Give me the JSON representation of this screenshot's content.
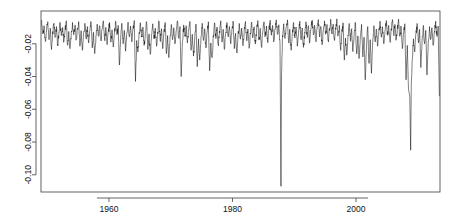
{
  "chart_data": {
    "type": "line",
    "title": "",
    "subtitle": "",
    "xlabel": "",
    "ylabel": "",
    "xlim": [
      1949.0,
      2013.6
    ],
    "ylim": [
      -0.1105,
      0.0
    ],
    "xticks": [
      1960,
      1980,
      2000
    ],
    "xtick_labels": [
      "1960",
      "1980",
      "2000"
    ],
    "yticks": [
      -0.02,
      -0.04,
      -0.06,
      -0.08,
      -0.1
    ],
    "ytick_labels": [
      "-0.02",
      "-0.04",
      "-0.06",
      "-0.08",
      "-0.10"
    ],
    "ytick_rotation": 90,
    "grid": false,
    "legend": false,
    "box": true,
    "line_color": "#000000",
    "line_width": 0.5,
    "background_color": "#ffffff",
    "axis_color": "#3c3c3c",
    "series": [
      {
        "name": "drawdown",
        "x": [
          1949.1,
          1949.3,
          1949.5,
          1949.7,
          1949.9,
          1950.1,
          1950.3,
          1950.5,
          1950.7,
          1950.9,
          1951.1,
          1951.3,
          1951.5,
          1951.7,
          1951.9,
          1952.1,
          1952.3,
          1952.5,
          1952.7,
          1952.9,
          1953.1,
          1953.3,
          1953.5,
          1953.7,
          1953.9,
          1954.1,
          1954.3,
          1954.5,
          1954.7,
          1954.9,
          1955.1,
          1955.3,
          1955.5,
          1955.7,
          1955.9,
          1956.1,
          1956.3,
          1956.5,
          1956.7,
          1956.9,
          1957.1,
          1957.3,
          1957.5,
          1957.7,
          1957.9,
          1958.1,
          1958.3,
          1958.5,
          1958.7,
          1958.9,
          1959.1,
          1959.3,
          1959.5,
          1959.7,
          1959.9,
          1960.1,
          1960.3,
          1960.5,
          1960.7,
          1960.9,
          1961.1,
          1961.3,
          1961.5,
          1961.7,
          1961.9,
          1962.1,
          1962.3,
          1962.5,
          1962.7,
          1962.9,
          1963.1,
          1963.3,
          1963.5,
          1963.7,
          1963.9,
          1964.1,
          1964.3,
          1964.5,
          1964.7,
          1964.9,
          1965.1,
          1965.3,
          1965.5,
          1965.7,
          1965.9,
          1966.1,
          1966.3,
          1966.5,
          1966.7,
          1966.9,
          1967.1,
          1967.3,
          1967.5,
          1967.7,
          1967.9,
          1968.1,
          1968.3,
          1968.5,
          1968.7,
          1968.9,
          1969.1,
          1969.3,
          1969.5,
          1969.7,
          1969.9,
          1970.1,
          1970.3,
          1970.5,
          1970.7,
          1970.9,
          1971.1,
          1971.3,
          1971.5,
          1971.7,
          1971.9,
          1972.1,
          1972.3,
          1972.5,
          1972.7,
          1972.9,
          1973.1,
          1973.3,
          1973.5,
          1973.7,
          1973.9,
          1974.1,
          1974.3,
          1974.5,
          1974.7,
          1974.9,
          1975.1,
          1975.3,
          1975.5,
          1975.7,
          1975.9,
          1976.1,
          1976.3,
          1976.5,
          1976.7,
          1976.9,
          1977.1,
          1977.3,
          1977.5,
          1977.7,
          1977.9,
          1978.1,
          1978.3,
          1978.5,
          1978.7,
          1978.9,
          1979.1,
          1979.3,
          1979.5,
          1979.7,
          1979.9,
          1980.1,
          1980.3,
          1980.5,
          1980.7,
          1980.9,
          1981.1,
          1981.3,
          1981.5,
          1981.7,
          1981.9,
          1982.1,
          1982.3,
          1982.5,
          1982.7,
          1982.9,
          1983.1,
          1983.3,
          1983.5,
          1983.7,
          1983.9,
          1984.1,
          1984.3,
          1984.5,
          1984.7,
          1984.9,
          1985.1,
          1985.3,
          1985.5,
          1985.7,
          1985.9,
          1986.1,
          1986.3,
          1986.5,
          1986.7,
          1986.9,
          1987.1,
          1987.3,
          1987.5,
          1987.7,
          1987.85,
          1987.95,
          1988.1,
          1988.3,
          1988.5,
          1988.7,
          1988.9,
          1989.1,
          1989.3,
          1989.5,
          1989.7,
          1989.9,
          1990.1,
          1990.3,
          1990.5,
          1990.7,
          1990.9,
          1991.1,
          1991.3,
          1991.5,
          1991.7,
          1991.9,
          1992.1,
          1992.3,
          1992.5,
          1992.7,
          1992.9,
          1993.1,
          1993.3,
          1993.5,
          1993.7,
          1993.9,
          1994.1,
          1994.3,
          1994.5,
          1994.7,
          1994.9,
          1995.1,
          1995.3,
          1995.5,
          1995.7,
          1995.9,
          1996.1,
          1996.3,
          1996.5,
          1996.7,
          1996.9,
          1997.1,
          1997.3,
          1997.5,
          1997.7,
          1997.9,
          1998.1,
          1998.3,
          1998.5,
          1998.7,
          1998.9,
          1999.1,
          1999.3,
          1999.5,
          1999.7,
          1999.9,
          2000.1,
          2000.3,
          2000.5,
          2000.7,
          2000.9,
          2001.1,
          2001.3,
          2001.5,
          2001.7,
          2001.9,
          2002.1,
          2002.3,
          2002.5,
          2002.7,
          2002.9,
          2003.1,
          2003.3,
          2003.5,
          2003.7,
          2003.9,
          2004.1,
          2004.3,
          2004.5,
          2004.7,
          2004.9,
          2005.1,
          2005.3,
          2005.5,
          2005.7,
          2005.9,
          2006.1,
          2006.3,
          2006.5,
          2006.7,
          2006.9,
          2007.1,
          2007.3,
          2007.5,
          2007.7,
          2007.9,
          2008.1,
          2008.3,
          2008.5,
          2008.7,
          2008.85,
          2008.95,
          2009.1,
          2009.3,
          2009.5,
          2009.7,
          2009.9,
          2010.1,
          2010.3,
          2010.5,
          2010.7,
          2010.9,
          2011.1,
          2011.3,
          2011.5,
          2011.7,
          2011.9,
          2012.1,
          2012.3,
          2012.5,
          2012.7,
          2012.9,
          2013.1,
          2013.3,
          2013.5
        ],
        "y": [
          -0.0055,
          -0.014,
          -0.009,
          -0.0185,
          -0.0115,
          -0.0065,
          -0.0175,
          -0.0105,
          -0.0235,
          -0.0125,
          -0.0075,
          -0.016,
          -0.0095,
          -0.0205,
          -0.013,
          -0.007,
          -0.015,
          -0.01,
          -0.019,
          -0.011,
          -0.006,
          -0.021,
          -0.0125,
          -0.023,
          -0.014,
          -0.007,
          -0.0145,
          -0.0085,
          -0.0175,
          -0.0105,
          -0.0065,
          -0.0215,
          -0.012,
          -0.024,
          -0.0135,
          -0.0075,
          -0.0165,
          -0.0095,
          -0.0195,
          -0.012,
          -0.0068,
          -0.0225,
          -0.013,
          -0.026,
          -0.015,
          -0.008,
          -0.0155,
          -0.009,
          -0.018,
          -0.011,
          -0.006,
          -0.017,
          -0.01,
          -0.0205,
          -0.0125,
          -0.007,
          -0.019,
          -0.0115,
          -0.022,
          -0.013,
          -0.0062,
          -0.0145,
          -0.0088,
          -0.033,
          -0.016,
          -0.0075,
          -0.02,
          -0.0118,
          -0.0245,
          -0.0135,
          -0.0068,
          -0.0155,
          -0.0092,
          -0.0188,
          -0.0112,
          -0.0058,
          -0.043,
          -0.018,
          -0.025,
          -0.013,
          -0.0072,
          -0.016,
          -0.0098,
          -0.021,
          -0.0125,
          -0.0065,
          -0.0235,
          -0.014,
          -0.0265,
          -0.0145,
          -0.0078,
          -0.017,
          -0.0105,
          -0.0215,
          -0.0128,
          -0.0062,
          -0.0185,
          -0.0108,
          -0.023,
          -0.0132,
          -0.007,
          -0.026,
          -0.015,
          -0.0285,
          -0.0155,
          -0.0082,
          -0.0175,
          -0.0102,
          -0.02,
          -0.012,
          -0.006,
          -0.0165,
          -0.0095,
          -0.04,
          -0.0185,
          -0.0085,
          -0.0155,
          -0.009,
          -0.0195,
          -0.0115,
          -0.0064,
          -0.024,
          -0.0142,
          -0.0275,
          -0.0158,
          -0.008,
          -0.034,
          -0.017,
          -0.03,
          -0.016,
          -0.0075,
          -0.018,
          -0.0108,
          -0.0225,
          -0.013,
          -0.0066,
          -0.0365,
          -0.0195,
          -0.0285,
          -0.015,
          -0.0072,
          -0.0168,
          -0.0098,
          -0.0205,
          -0.0122,
          -0.006,
          -0.019,
          -0.0112,
          -0.0235,
          -0.0138,
          -0.007,
          -0.0158,
          -0.0094,
          -0.0198,
          -0.0118,
          -0.0062,
          -0.023,
          -0.0136,
          -0.0255,
          -0.0144,
          -0.0076,
          -0.0172,
          -0.0104,
          -0.0212,
          -0.0126,
          -0.0064,
          -0.0182,
          -0.011,
          -0.0228,
          -0.0134,
          -0.0068,
          -0.0162,
          -0.0096,
          -0.0202,
          -0.012,
          -0.0058,
          -0.0176,
          -0.0106,
          -0.022,
          -0.0128,
          -0.0066,
          -0.0154,
          -0.0092,
          -0.0194,
          -0.0116,
          -0.0056,
          -0.0148,
          -0.0088,
          -0.0186,
          -0.0112,
          -0.0054,
          -0.0142,
          -0.0084,
          -0.02,
          -0.107,
          -0.038,
          -0.015,
          -0.0078,
          -0.0168,
          -0.01,
          -0.0054,
          -0.0186,
          -0.0112,
          -0.024,
          -0.0136,
          -0.007,
          -0.0165,
          -0.0098,
          -0.0215,
          -0.0128,
          -0.0062,
          -0.0174,
          -0.0104,
          -0.0222,
          -0.013,
          -0.0066,
          -0.0152,
          -0.009,
          -0.0192,
          -0.0114,
          -0.0056,
          -0.0146,
          -0.0086,
          -0.0184,
          -0.011,
          -0.0052,
          -0.0158,
          -0.0094,
          -0.0206,
          -0.0122,
          -0.006,
          -0.014,
          -0.0082,
          -0.0178,
          -0.0106,
          -0.005,
          -0.0136,
          -0.008,
          -0.0172,
          -0.0102,
          -0.0048,
          -0.015,
          -0.0088,
          -0.0235,
          -0.014,
          -0.0072,
          -0.03,
          -0.0165,
          -0.027,
          -0.0148,
          -0.0076,
          -0.018,
          -0.0108,
          -0.0248,
          -0.0142,
          -0.007,
          -0.026,
          -0.0152,
          -0.029,
          -0.0158,
          -0.0082,
          -0.028,
          -0.016,
          -0.042,
          -0.02,
          -0.0095,
          -0.032,
          -0.0175,
          -0.038,
          -0.019,
          -0.009,
          -0.0185,
          -0.011,
          -0.0215,
          -0.0126,
          -0.0062,
          -0.016,
          -0.0096,
          -0.02,
          -0.0118,
          -0.0058,
          -0.0148,
          -0.0088,
          -0.0182,
          -0.0108,
          -0.0052,
          -0.0138,
          -0.0082,
          -0.0174,
          -0.0104,
          -0.005,
          -0.0155,
          -0.0092,
          -0.023,
          -0.0136,
          -0.0078,
          -0.042,
          -0.021,
          -0.048,
          -0.052,
          -0.085,
          -0.045,
          -0.03,
          -0.017,
          -0.025,
          -0.014,
          -0.0076,
          -0.019,
          -0.0112,
          -0.0345,
          -0.018,
          -0.0088,
          -0.02,
          -0.0118,
          -0.039,
          -0.0195,
          -0.0095,
          -0.017,
          -0.0102,
          -0.021,
          -0.0124,
          -0.0062,
          -0.0155,
          -0.0092,
          -0.052
        ]
      }
    ],
    "annotations": [
      {
        "label": "deepest drawdown",
        "x": 1987.85,
        "y": -0.107
      },
      {
        "label": "second deepest drawdown",
        "x": 2008.85,
        "y": -0.085
      }
    ]
  },
  "figure": {
    "plot_left_px": 41,
    "plot_right_px": 440,
    "plot_top_px": 11,
    "plot_bottom_px": 192
  }
}
